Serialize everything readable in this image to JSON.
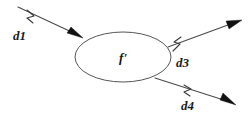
{
  "diagram": {
    "type": "data-flow-diagram",
    "width": 251,
    "height": 118,
    "background_color": "#ffffff",
    "line_color": "#4a4a4a",
    "arrow_color": "#111111",
    "text_color": "#1a1a1a",
    "process": {
      "label": "f'",
      "shape": "ellipse",
      "cx": 123,
      "cy": 57,
      "rx": 48,
      "ry": 25,
      "fill": "#ffffff",
      "stroke": "#555555"
    },
    "flows": [
      {
        "id": "d1",
        "label": "d1",
        "direction": "incoming",
        "from": [
          18,
          7
        ],
        "to": [
          82,
          37
        ],
        "label_x": 13,
        "label_y": 40,
        "tick_x": 31,
        "tick_y": 15
      },
      {
        "id": "d3",
        "label": "d3",
        "direction": "outgoing",
        "from": [
          168,
          47
        ],
        "to": [
          240,
          21
        ],
        "label_x": 176,
        "label_y": 67,
        "tick_x": 177,
        "tick_y": 42
      },
      {
        "id": "d4",
        "label": "d4",
        "direction": "outgoing",
        "from": [
          155,
          78
        ],
        "to": [
          234,
          104
        ],
        "label_x": 181,
        "label_y": 110,
        "tick_x": 188,
        "tick_y": 89
      }
    ]
  }
}
